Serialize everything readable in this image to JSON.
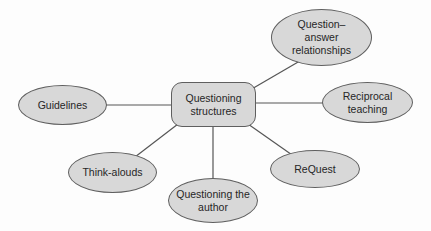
{
  "diagram": {
    "title_semantic": "Questioning structures concept map",
    "center": {
      "id": "questioning-structures",
      "label": "Questioning\nstructures"
    },
    "nodes": [
      {
        "id": "question-answer-relationships",
        "label": "Question–\nanswer\nrelationships"
      },
      {
        "id": "guidelines",
        "label": "Guidelines"
      },
      {
        "id": "reciprocal-teaching",
        "label": "Reciprocal\nteaching"
      },
      {
        "id": "think-alouds",
        "label": "Think-alouds"
      },
      {
        "id": "questioning-the-author",
        "label": "Questioning the\nauthor"
      },
      {
        "id": "request",
        "label": "ReQuest"
      }
    ],
    "edges": [
      {
        "from": "questioning-structures",
        "to": "question-answer-relationships"
      },
      {
        "from": "questioning-structures",
        "to": "guidelines"
      },
      {
        "from": "questioning-structures",
        "to": "reciprocal-teaching"
      },
      {
        "from": "questioning-structures",
        "to": "think-alouds"
      },
      {
        "from": "questioning-structures",
        "to": "questioning-the-author"
      },
      {
        "from": "questioning-structures",
        "to": "request"
      }
    ],
    "colors": {
      "node_fill": "#d8d8d8",
      "node_border": "#5f5f5f",
      "connector": "#565656",
      "text": "#262626",
      "background": "#fdfdfd"
    }
  }
}
